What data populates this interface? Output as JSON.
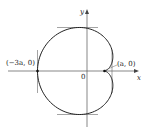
{
  "diagram": {
    "type": "cardioid",
    "axes": {
      "x_label": "x",
      "y_label": "y",
      "origin_label": "0"
    },
    "points": [
      {
        "label": "(−3a, 0)",
        "x": -3,
        "y": 0
      },
      {
        "label": "(a, 0)",
        "x": 1,
        "y": 0
      }
    ],
    "tangent_lines": [
      "horizontal-top",
      "horizontal-bottom",
      "vertical-left",
      "vertical-right"
    ],
    "colors": {
      "curve": "#222222",
      "axes": "#555555",
      "tangents": "#666666"
    }
  }
}
